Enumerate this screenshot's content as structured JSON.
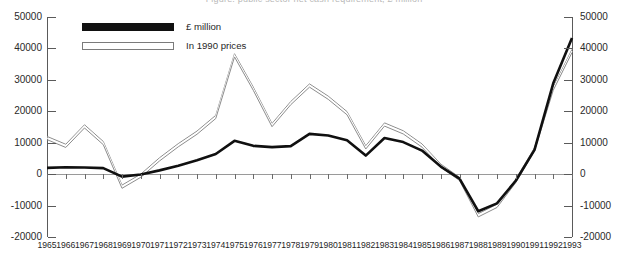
{
  "title_clipped": "Figure: public sector net cash requirement, £ million",
  "legend": {
    "position": "top-left-inside",
    "items": [
      {
        "label": "£ million",
        "style": "solid-black",
        "color": "#111111"
      },
      {
        "label": "In 1990 prices",
        "style": "hollow-outline",
        "color": "#8d8d8d"
      }
    ]
  },
  "axes": {
    "y_left_ticks": [
      "50000",
      "40000",
      "30000",
      "20000",
      "10000",
      "0",
      "-10000",
      "-20000"
    ],
    "y_right_ticks": [
      "50000",
      "40000",
      "30000",
      "20000",
      "10000",
      "0",
      "-10000",
      "-20000"
    ],
    "y_min": -20000,
    "y_max": 50000,
    "y_step": 10000,
    "x_label_years": [
      "1965",
      "1966",
      "1967",
      "1968",
      "1969",
      "1970",
      "1971",
      "1972",
      "1973",
      "1974",
      "1975",
      "1976",
      "1977",
      "1978",
      "1979",
      "1980",
      "1981",
      "1982",
      "1983",
      "1984",
      "1985",
      "1986",
      "1987",
      "1988",
      "1989",
      "1990",
      "1991",
      "1992",
      "1993"
    ]
  },
  "chart_data": {
    "type": "line",
    "title": "",
    "xlabel": "",
    "ylabel": "",
    "ylim": [
      -20000,
      50000
    ],
    "ygrid": false,
    "legend_position": "upper left",
    "dual_axis": true,
    "x": [
      1965,
      1966,
      1967,
      1968,
      1969,
      1970,
      1971,
      1972,
      1973,
      1974,
      1975,
      1976,
      1977,
      1978,
      1979,
      1980,
      1981,
      1982,
      1983,
      1984,
      1985,
      1986,
      1987,
      1988,
      1989,
      1990,
      1991,
      1992,
      1993
    ],
    "series": [
      {
        "name": "£ million",
        "color": "#111111",
        "values": [
          2000,
          2200,
          2100,
          1900,
          -800,
          -100,
          1200,
          2700,
          4400,
          6400,
          10600,
          9000,
          8600,
          8900,
          12800,
          12300,
          10800,
          5900,
          11500,
          10200,
          7500,
          2400,
          -1400,
          -11800,
          -9300,
          -2100,
          7700,
          28900,
          43300
        ]
      },
      {
        "name": "In 1990 prices",
        "color": "#8d8d8d",
        "values": [
          11500,
          9000,
          15200,
          9900,
          -4000,
          -500,
          4700,
          9200,
          13200,
          18200,
          37800,
          27200,
          15600,
          22600,
          28200,
          24300,
          19400,
          8500,
          15800,
          13300,
          9100,
          2700,
          -1500,
          -13100,
          -10100,
          -2200,
          7900,
          27200,
          39200
        ]
      }
    ]
  }
}
